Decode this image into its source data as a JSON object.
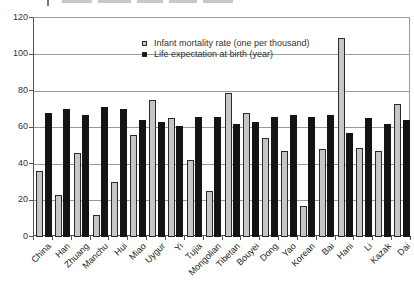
{
  "chart_data": {
    "type": "bar",
    "categories": [
      "China",
      "Han",
      "Zhuang",
      "Manchu",
      "Hui",
      "Miao",
      "Uygur",
      "Yi",
      "Tujia",
      "Mongolian",
      "Tibetan",
      "Bouyei",
      "Dong",
      "Yao",
      "Korean",
      "Bai",
      "Hani",
      "Li",
      "Kazak",
      "Dai"
    ],
    "series": [
      {
        "name": "Infant mortality rate (one per thousand)",
        "color": "#c6c6c6",
        "values": [
          36,
          23,
          46,
          12,
          30,
          56,
          75,
          65,
          42,
          25,
          79,
          68,
          54,
          47,
          17,
          48,
          109,
          49,
          47,
          73
        ]
      },
      {
        "name": "Life expectation at birth (year)",
        "color": "#141414",
        "values": [
          68,
          70,
          67,
          71,
          70,
          64,
          63,
          61,
          66,
          66,
          62,
          63,
          66,
          67,
          66,
          67,
          57,
          65,
          62,
          64
        ]
      }
    ],
    "title": "",
    "xlabel": "",
    "ylabel": "",
    "ylim": [
      0,
      120
    ],
    "yticks": [
      0,
      20,
      40,
      60,
      80,
      100,
      120
    ],
    "grid": true,
    "legend_position": "inside-top-center"
  }
}
